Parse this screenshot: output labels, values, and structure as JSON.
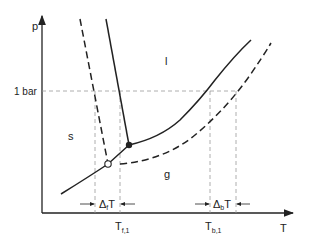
{
  "diagram": {
    "type": "phase-diagram",
    "axes": {
      "y_label": "p",
      "x_label": "T",
      "y_tick": "1 bar"
    },
    "regions": {
      "solid": "s",
      "liquid": "l",
      "gas": "g"
    },
    "x_ticks": {
      "freezing": {
        "main": "T",
        "sub": "f,1"
      },
      "boiling": {
        "main": "T",
        "sub": "b,1"
      }
    },
    "annotations": {
      "freezing_delta": {
        "delta": "Δ",
        "sub": "f",
        "main": "T"
      },
      "boiling_delta": {
        "delta": "Δ",
        "sub": "b",
        "main": "T"
      }
    },
    "curves": [
      {
        "name": "pure solvent phase boundaries",
        "style": "solid"
      },
      {
        "name": "solution phase boundaries",
        "style": "dashed"
      }
    ],
    "points": [
      {
        "name": "triple point (pure)",
        "style": "filled"
      },
      {
        "name": "triple point (solution)",
        "style": "open"
      }
    ],
    "colors": {
      "line": "#222222",
      "guide": "#888888"
    }
  }
}
